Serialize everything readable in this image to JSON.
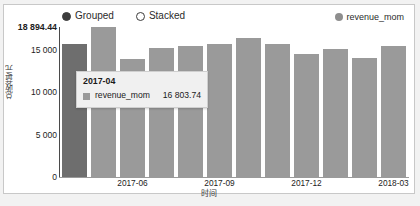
{
  "legend": {
    "mode_options": [
      {
        "label": "Grouped",
        "selected": true
      },
      {
        "label": "Stacked",
        "selected": false
      }
    ],
    "series_label": "revenue_mom",
    "series_color": "#8e8e8e"
  },
  "tooltip": {
    "title": "2017-04",
    "series_name": "revenue_mom",
    "value": "16 803.74",
    "swatch_color": "#9a9a9a"
  },
  "axes": {
    "y_title": "总收益/元",
    "x_title": "时间",
    "y_ticks": [
      "18 894.44",
      "15 000",
      "10 000",
      "5 000",
      "0"
    ]
  },
  "chart_data": {
    "type": "bar",
    "title": "",
    "xlabel": "时间",
    "ylabel": "总收益/元",
    "ylim": [
      0,
      18894.44
    ],
    "grid": false,
    "legend_position": "top-right",
    "bar_color": "#9a9a9a",
    "highlight_color": "#6e6e6e",
    "highlight_index": 0,
    "categories": [
      "2017-04",
      "2017-05",
      "2017-06",
      "2017-07",
      "2017-08",
      "2017-09",
      "2017-10",
      "2017-11",
      "2017-12",
      "2018-01",
      "2018-02",
      "2018-03"
    ],
    "visible_tick_labels": [
      "",
      "",
      "2017-06",
      "",
      "",
      "2017-09",
      "",
      "",
      "2017-12",
      "",
      "",
      "2018-03"
    ],
    "series": [
      {
        "name": "revenue_mom",
        "values": [
          16803.74,
          18894.44,
          14900.0,
          16200.0,
          16550.0,
          16800.0,
          17500.0,
          16800.0,
          15500.0,
          16100.0,
          15000.0,
          16500.0
        ]
      }
    ]
  }
}
